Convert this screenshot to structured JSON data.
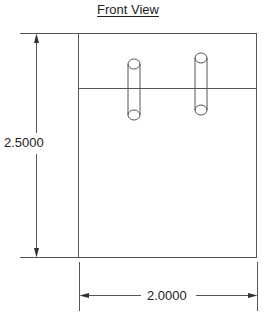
{
  "view": {
    "title": "Front View"
  },
  "dimensions": {
    "height": "2.5000",
    "width": "2.0000"
  },
  "colors": {
    "line": "#555555",
    "background": "#ffffff"
  },
  "features": [
    {
      "name": "left-cylinder",
      "cx": 134,
      "top_cy": 64,
      "bottom_cy": 115,
      "rx": 6,
      "ry": 5
    },
    {
      "name": "right-cylinder",
      "cx": 201,
      "top_cy": 58,
      "bottom_cy": 110,
      "rx": 6,
      "ry": 5
    }
  ]
}
